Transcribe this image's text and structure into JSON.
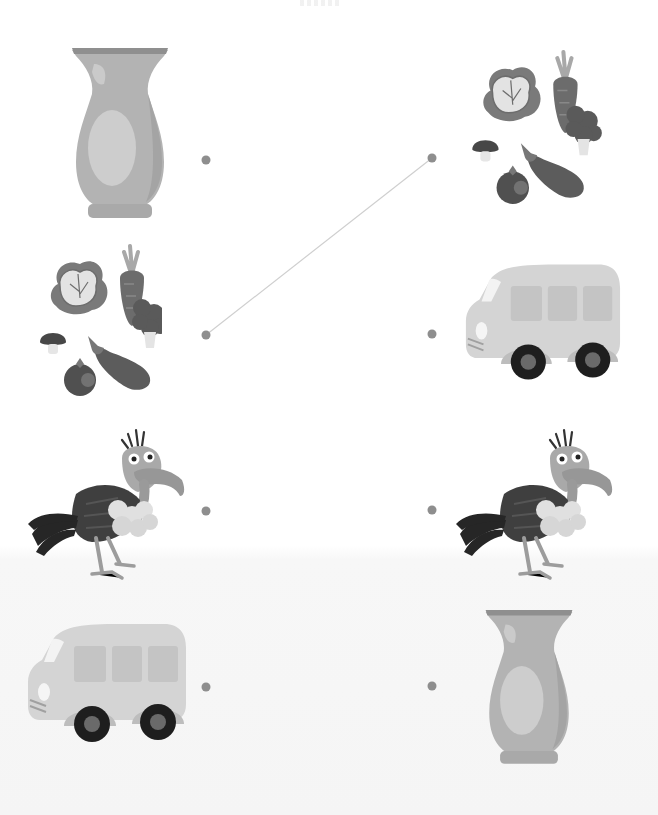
{
  "worksheet": {
    "type": "match-the-pictures",
    "header_mark": "",
    "left_column": [
      {
        "id": "vase",
        "label": "Vase",
        "dot": {
          "x": 206,
          "y": 160
        }
      },
      {
        "id": "vegetables",
        "label": "Vegetables",
        "dot": {
          "x": 206,
          "y": 335
        }
      },
      {
        "id": "vulture",
        "label": "Vulture",
        "dot": {
          "x": 206,
          "y": 511
        }
      },
      {
        "id": "van",
        "label": "Van",
        "dot": {
          "x": 206,
          "y": 687
        }
      }
    ],
    "right_column": [
      {
        "id": "vegetables",
        "label": "Vegetables",
        "dot": {
          "x": 432,
          "y": 158
        }
      },
      {
        "id": "van",
        "label": "Van",
        "dot": {
          "x": 432,
          "y": 334
        }
      },
      {
        "id": "vulture",
        "label": "Vulture",
        "dot": {
          "x": 432,
          "y": 510
        }
      },
      {
        "id": "vase",
        "label": "Vase",
        "dot": {
          "x": 432,
          "y": 686
        }
      }
    ],
    "connections": [
      {
        "from": "left.vegetables",
        "to": "right.vegetables"
      }
    ],
    "colors": {
      "dot": "#8e8e8e",
      "line": "#cfcfcf",
      "background_top": "#ffffff",
      "background_bottom": "#f5f5f5"
    }
  }
}
